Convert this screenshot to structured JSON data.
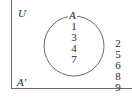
{
  "diagram": {
    "type": "venn",
    "universal_label": "U",
    "set_label": "A",
    "complement_label": "A′",
    "inside_set": [
      "1",
      "3",
      "4",
      "7"
    ],
    "outside_set": [
      "2",
      "5",
      "6",
      "8",
      "9"
    ],
    "colors": {
      "line": "#6a6a6a",
      "text": "#2a2a2a",
      "background": "#ffffff"
    }
  }
}
